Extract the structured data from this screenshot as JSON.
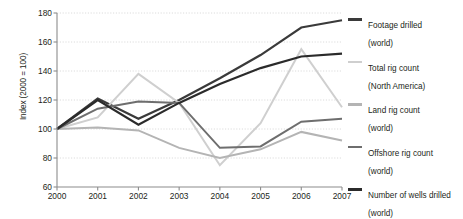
{
  "chart_data": {
    "type": "line",
    "title": "",
    "xlabel": "",
    "ylabel": "Index (2000 = 100)",
    "x": [
      2000,
      2001,
      2002,
      2003,
      2004,
      2005,
      2006,
      2007
    ],
    "categories": [
      "2000",
      "2001",
      "2002",
      "2003",
      "2004",
      "2005",
      "2006",
      "2007"
    ],
    "xlim": [
      2000,
      2007
    ],
    "ylim": [
      60,
      180
    ],
    "yticks": [
      60,
      80,
      100,
      120,
      140,
      160,
      180
    ],
    "grid": "horizontal-dotted",
    "legend_position": "right",
    "series": [
      {
        "name": "Footage drilled (world)",
        "label_line1": "Footage drilled",
        "label_line2": "(world)",
        "color": "#3a3a3a",
        "width": 2.2,
        "values": [
          100,
          121,
          107,
          120,
          135,
          151,
          170,
          175
        ]
      },
      {
        "name": "Total rig count (North America)",
        "label_line1": "Total rig count",
        "label_line2": "(North America)",
        "color": "#cfcfcf",
        "width": 2.0,
        "values": [
          100,
          108,
          138,
          118,
          75,
          104,
          155,
          115
        ]
      },
      {
        "name": "Land rig count (world)",
        "label_line1": "Land rig count",
        "label_line2": "(world)",
        "color": "#b4b4b4",
        "width": 2.0,
        "values": [
          100,
          101,
          99,
          87,
          80,
          86,
          98,
          92
        ]
      },
      {
        "name": "Offshore rig count (world)",
        "label_line1": "Offshore rig count",
        "label_line2": "(world)",
        "color": "#6e6e6e",
        "width": 2.0,
        "values": [
          100,
          114,
          119,
          118,
          87,
          88,
          105,
          107
        ]
      },
      {
        "name": "Number of wells drilled (world)",
        "label_line1": "Number of wells drilled",
        "label_line2": "(world)",
        "color": "#2b2b2b",
        "width": 2.2,
        "values": [
          100,
          120,
          103,
          118,
          131,
          142,
          150,
          152
        ]
      }
    ]
  },
  "axis": {
    "line_color": "#8c8c8c",
    "grid_color": "#dcdcdc"
  }
}
